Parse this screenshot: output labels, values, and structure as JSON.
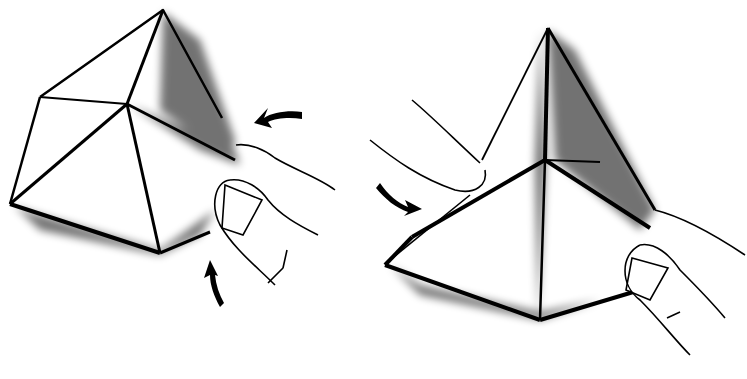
{
  "figure": {
    "background": "#ffffff",
    "ink": "#000000",
    "panels": [
      {
        "name": "step-left",
        "arrows": [
          "curved-arrow-left",
          "curved-arrow-up"
        ]
      },
      {
        "name": "step-right",
        "arrows": [
          "curved-arrow-down-right"
        ]
      }
    ]
  }
}
